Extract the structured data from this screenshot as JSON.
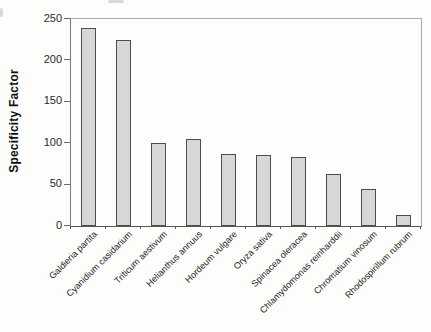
{
  "chart_data": {
    "type": "bar",
    "title": "",
    "xlabel": "",
    "ylabel": "Specificity Factor",
    "ylim": [
      0,
      250
    ],
    "yticks": [
      0,
      50,
      100,
      150,
      200,
      250
    ],
    "grid": false,
    "legend": "none",
    "categories": [
      "Galdieria partita",
      "Cyanidium casidarium",
      "Triticum aestivum",
      "Helianthus annuus",
      "Hordeum vulgare",
      "Oryza sativa",
      "Spinacea oleracea",
      "Chlamydomonas reinharddii",
      "Chromatium vinosum",
      "Rhodospirillum rubrum"
    ],
    "values": [
      238,
      224,
      99,
      104,
      86,
      85,
      82,
      61,
      44,
      12
    ],
    "bar_fill_color": "#d7d7d7",
    "bar_border_color": "#4d4d4d",
    "axis_color": "#555555",
    "background_color": "#fdfdfc"
  }
}
